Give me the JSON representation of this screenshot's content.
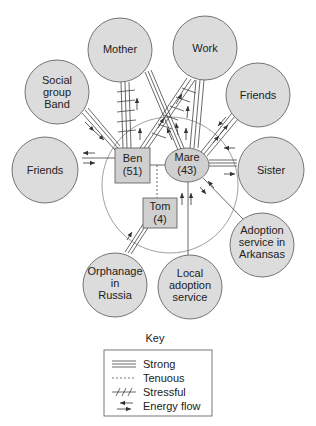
{
  "diagram": {
    "type": "ecomap",
    "family": {
      "members": [
        {
          "id": "ben",
          "name": "Ben",
          "age": "(51)",
          "shape": "square"
        },
        {
          "id": "mare",
          "name": "Mare",
          "age": "(43)",
          "shape": "circle"
        },
        {
          "id": "tom",
          "name": "Tom",
          "age": "(4)",
          "shape": "square"
        }
      ]
    },
    "systems": [
      {
        "id": "mother",
        "lines": [
          "Mother"
        ]
      },
      {
        "id": "work",
        "lines": [
          "Work"
        ]
      },
      {
        "id": "social",
        "lines": [
          "Social",
          "group",
          "Band"
        ]
      },
      {
        "id": "friends_right",
        "lines": [
          "Friends"
        ]
      },
      {
        "id": "friends_left",
        "lines": [
          "Friends"
        ]
      },
      {
        "id": "sister",
        "lines": [
          "Sister"
        ]
      },
      {
        "id": "arkansas",
        "lines": [
          "Adoption",
          "service in",
          "Arkansas"
        ]
      },
      {
        "id": "russia",
        "lines": [
          "Orphanage",
          "in",
          "Russia"
        ]
      },
      {
        "id": "local",
        "lines": [
          "Local",
          "adoption",
          "service"
        ]
      }
    ],
    "connections": [
      {
        "from": "ben",
        "to": "mother",
        "type": "stressful-strong",
        "energy": "to-mother"
      },
      {
        "from": "ben",
        "to": "work",
        "type": "stressful-strong",
        "energy": "to-work"
      },
      {
        "from": "mare",
        "to": "mother",
        "type": "strong",
        "energy": "to-mother"
      },
      {
        "from": "mare",
        "to": "work",
        "type": "strong",
        "energy": "to-work"
      },
      {
        "from": "ben",
        "to": "social",
        "type": "strong",
        "energy": "to-ben"
      },
      {
        "from": "ben",
        "to": "friends_left",
        "type": "normal",
        "energy": "both"
      },
      {
        "from": "mare",
        "to": "friends_right",
        "type": "strong",
        "energy": "both"
      },
      {
        "from": "mare",
        "to": "sister",
        "type": "strong",
        "energy": "both"
      },
      {
        "from": "mare",
        "to": "arkansas",
        "type": "normal",
        "energy": "both"
      },
      {
        "from": "ben",
        "to": "mare",
        "type": "normal",
        "energy": "none"
      },
      {
        "from": "ben",
        "to": "tom",
        "type": "tenuous",
        "energy": "none"
      },
      {
        "from": "tom",
        "to": "russia",
        "type": "strong",
        "energy": "to-tom"
      },
      {
        "from": "mare",
        "to": "local",
        "type": "normal",
        "energy": "to-mare"
      }
    ]
  },
  "key": {
    "title": "Key",
    "items": [
      {
        "symbol": "strong-line",
        "label": "Strong"
      },
      {
        "symbol": "tenuous-line",
        "label": "Tenuous"
      },
      {
        "symbol": "stressful-line",
        "label": "Stressful"
      },
      {
        "symbol": "energy-arrows",
        "label": "Energy flow"
      }
    ]
  }
}
